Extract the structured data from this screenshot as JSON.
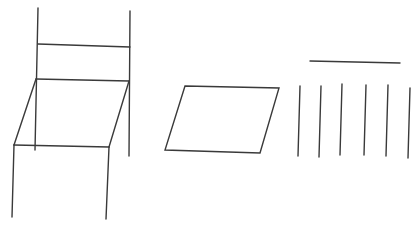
{
  "canvas": {
    "width": 420,
    "height": 231,
    "background": "#ffffff",
    "stroke_color": "#3a3a3a"
  },
  "figures": {
    "chair": {
      "lines": [
        {
          "name": "back-post-left",
          "x1": 38,
          "y1": 8,
          "x2": 35,
          "y2": 150
        },
        {
          "name": "back-post-right",
          "x1": 130,
          "y1": 11,
          "x2": 129,
          "y2": 156
        },
        {
          "name": "backrest-bar",
          "x1": 38,
          "y1": 44,
          "x2": 130,
          "y2": 47
        },
        {
          "name": "seat-back-edge",
          "x1": 36,
          "y1": 79,
          "x2": 129,
          "y2": 81
        },
        {
          "name": "seat-left-edge",
          "x1": 36,
          "y1": 79,
          "x2": 14,
          "y2": 145
        },
        {
          "name": "seat-right-edge",
          "x1": 129,
          "y1": 81,
          "x2": 109,
          "y2": 147
        },
        {
          "name": "seat-front-edge",
          "x1": 14,
          "y1": 145,
          "x2": 109,
          "y2": 147
        },
        {
          "name": "front-leg-left",
          "x1": 14,
          "y1": 145,
          "x2": 12,
          "y2": 217
        },
        {
          "name": "front-leg-right",
          "x1": 109,
          "y1": 147,
          "x2": 106,
          "y2": 219
        }
      ]
    },
    "parallelogram": {
      "points": "185,86 279,88 260,153 165,150"
    },
    "bars": {
      "lines": [
        {
          "name": "top-bar",
          "x1": 310,
          "y1": 61,
          "x2": 400,
          "y2": 63
        },
        {
          "name": "vertical-line-1",
          "x1": 300,
          "y1": 86,
          "x2": 298,
          "y2": 156
        },
        {
          "name": "vertical-line-2",
          "x1": 321,
          "y1": 86,
          "x2": 319,
          "y2": 157
        },
        {
          "name": "vertical-line-3",
          "x1": 342,
          "y1": 84,
          "x2": 340,
          "y2": 155
        },
        {
          "name": "vertical-line-4",
          "x1": 366,
          "y1": 85,
          "x2": 364,
          "y2": 155
        },
        {
          "name": "vertical-line-5",
          "x1": 388,
          "y1": 85,
          "x2": 386,
          "y2": 156
        },
        {
          "name": "vertical-line-6",
          "x1": 410,
          "y1": 88,
          "x2": 408,
          "y2": 158
        }
      ]
    }
  }
}
